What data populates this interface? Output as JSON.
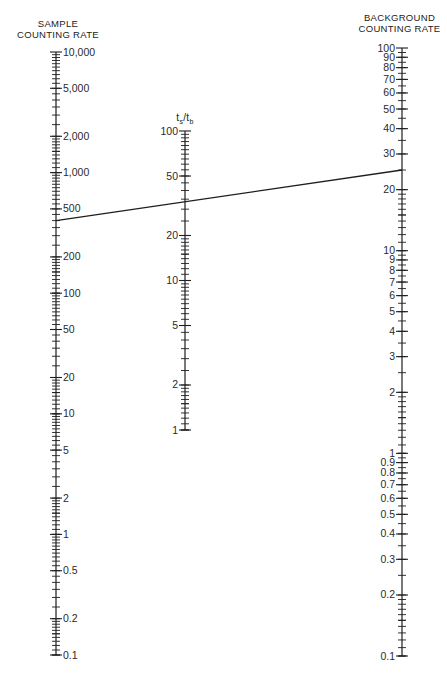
{
  "diagram": {
    "type": "nomogram",
    "ink_color": "#1e1e1e",
    "background": "#ffffff",
    "axes": [
      {
        "id": "sample",
        "title_lines": [
          "SAMPLE",
          "COUNTING RATE"
        ],
        "scale": "log",
        "min": 0.1,
        "max": 10000,
        "labels": [
          "10,000",
          "5,000",
          "2,000",
          "1,000",
          "500",
          "200",
          "100",
          "50",
          "20",
          "10",
          "5",
          "2",
          "1",
          "0.5",
          "0.2",
          "0.1"
        ],
        "label_values": [
          10000,
          5000,
          2000,
          1000,
          500,
          200,
          100,
          50,
          20,
          10,
          5,
          2,
          1,
          0.5,
          0.2,
          0.1
        ],
        "label_side": "right"
      },
      {
        "id": "ratio",
        "title": "ts/tb",
        "title_main_1": "t",
        "title_sub_1": "s",
        "title_slash": "/t",
        "title_sub_2": "b",
        "scale": "log",
        "min": 1,
        "max": 100,
        "labels": [
          "100",
          "50",
          "20",
          "10",
          "5",
          "2",
          "1"
        ],
        "label_values": [
          100,
          50,
          20,
          10,
          5,
          2,
          1
        ],
        "label_side": "left"
      },
      {
        "id": "background",
        "title_lines": [
          "BACKGROUND",
          "COUNTING RATE"
        ],
        "scale": "log",
        "min": 0.1,
        "max": 100,
        "labels": [
          "0.1",
          "0.2",
          "0.3",
          "0.4",
          "0.5",
          "0.6",
          "0.7",
          "0.8",
          "0.9",
          "1",
          "2",
          "3",
          "4",
          "5",
          "6",
          "7",
          "8",
          "9",
          "10",
          "20",
          "30",
          "40",
          "50",
          "60",
          "70",
          "80",
          "90",
          "100"
        ],
        "label_values": [
          0.1,
          0.2,
          0.3,
          0.4,
          0.5,
          0.6,
          0.7,
          0.8,
          0.9,
          1,
          2,
          3,
          4,
          5,
          6,
          7,
          8,
          9,
          10,
          20,
          30,
          40,
          50,
          60,
          70,
          80,
          90,
          100
        ],
        "label_side": "left"
      }
    ],
    "isopleth": {
      "sample_value": 400,
      "ratio_value": 4,
      "background_value": 25
    }
  }
}
